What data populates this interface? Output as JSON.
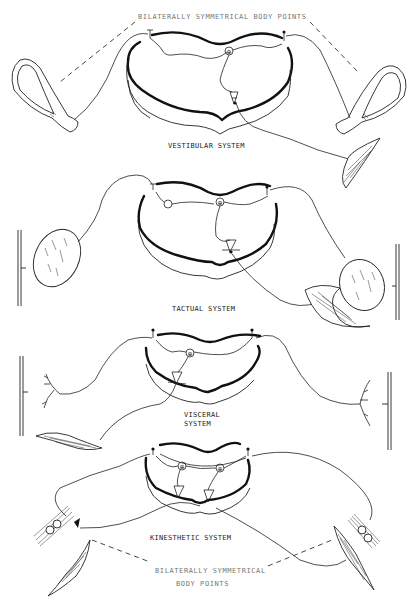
{
  "figure": {
    "top_annotation": "BILATERALLY SYMMETRICAL BODY POINTS",
    "bottom_annotation_line1": "BILATERALLY SYMMETRICAL",
    "bottom_annotation_line2": "BODY POINTS",
    "panels": [
      {
        "id": "vestibular",
        "label": "VESTIBULAR SYSTEM",
        "receptor": "semicircular-canal"
      },
      {
        "id": "tactual",
        "label": "TACTUAL SYSTEM",
        "receptor": "encapsulated-corpuscle"
      },
      {
        "id": "visceral",
        "label_line1": "VISCERAL",
        "label_line2": "SYSTEM",
        "receptor": "free-nerve-ending"
      },
      {
        "id": "kinesthetic",
        "label": "KINESTHETIC SYSTEM",
        "receptor": "joint-receptor"
      }
    ],
    "cell_markers": {
      "sensory": "⊕",
      "motor": "A"
    }
  }
}
